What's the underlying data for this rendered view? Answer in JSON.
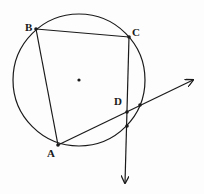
{
  "diagram": {
    "type": "circle-geometry",
    "circle": {
      "cx": 79,
      "cy": 80,
      "r": 66,
      "center_dot": true
    },
    "points": {
      "A": {
        "label": "A",
        "x": 58,
        "y": 145,
        "label_x": 47,
        "label_y": 157
      },
      "B": {
        "label": "B",
        "x": 36,
        "y": 29,
        "label_x": 25,
        "label_y": 31
      },
      "C": {
        "label": "C",
        "x": 129,
        "y": 37,
        "label_x": 132,
        "label_y": 36
      },
      "D": {
        "label": "D",
        "x": 127,
        "y": 112,
        "label_x": 114,
        "label_y": 105
      }
    },
    "segments": [
      {
        "from": "A",
        "to": "B"
      },
      {
        "from": "B",
        "to": "C"
      }
    ],
    "rays": [
      {
        "from": "A",
        "direction_to": [
          193,
          80
        ],
        "label": "ray-AD"
      },
      {
        "from": "C",
        "direction_to": [
          125,
          183
        ],
        "label": "ray-CD"
      }
    ],
    "intersection_dots": [
      {
        "x": 140,
        "y": 105
      },
      {
        "x": 127,
        "y": 126
      }
    ],
    "stroke_color": "#1a1a1a"
  }
}
